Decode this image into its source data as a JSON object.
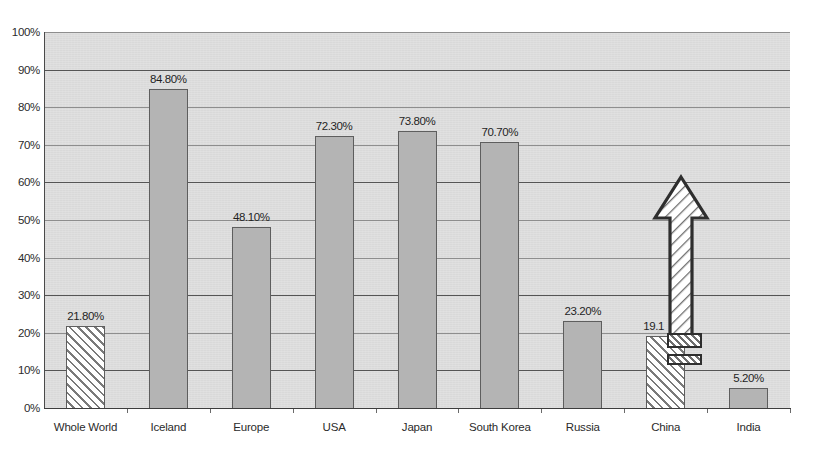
{
  "chart_data": {
    "type": "bar",
    "title": "",
    "subtitle": "",
    "xlabel": "",
    "ylabel": "",
    "categories": [
      "Whole World",
      "Iceland",
      "Europe",
      "USA",
      "Japan",
      "South Korea",
      "Russia",
      "China",
      "India"
    ],
    "values": [
      21.8,
      84.8,
      48.1,
      72.3,
      73.8,
      70.7,
      23.2,
      19.1,
      5.2
    ],
    "data_labels": [
      "21.80%",
      "84.80%",
      "48.10%",
      "72.30%",
      "73.80%",
      "70.70%",
      "23.20%",
      "19.1",
      "5.20%"
    ],
    "bar_styles": [
      "hatched",
      "solid",
      "solid",
      "solid",
      "solid",
      "solid",
      "solid",
      "hatched",
      "solid"
    ],
    "ylim": [
      0,
      100
    ],
    "ytick_values": [
      0,
      10,
      20,
      30,
      40,
      50,
      60,
      70,
      80,
      90,
      100
    ],
    "ytick_labels": [
      "0%",
      "10%",
      "20%",
      "30%",
      "40%",
      "50%",
      "60%",
      "70%",
      "80%",
      "90%",
      "100%"
    ],
    "major_gridlines": [
      10,
      30,
      60,
      90
    ],
    "grid": true,
    "legend": "none",
    "annotations": [
      {
        "name": "growth-arrow",
        "shape": "up-arrow",
        "over_category": "China",
        "fill": "hatched",
        "tip_value": 61,
        "base_value": 22
      },
      {
        "name": "arrow-tail-rect-upper",
        "shape": "rectangle",
        "fill": "hatched"
      },
      {
        "name": "arrow-tail-rect-lower",
        "shape": "rectangle",
        "fill": "hatched"
      }
    ],
    "colors": {
      "plot_background": "#d9d9d9",
      "bar_solid_fill": "#b4b4b4",
      "bar_outline": "#5e5e5e",
      "gridline": "#8e8e8e",
      "gridline_major": "#555555",
      "axis": "#3d3d3d",
      "text": "#2b2b2b",
      "page_background": "#ffffff"
    }
  }
}
